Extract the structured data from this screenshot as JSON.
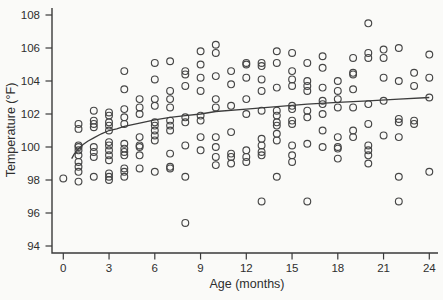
{
  "figure": {
    "background_color": "#fafaf8",
    "ink_color": "#3a3a3a",
    "marker_color": "#464646",
    "curve_color": "#3c3c3c",
    "marker": "open-circle"
  },
  "chart_data": {
    "type": "scatter",
    "title": "",
    "xlabel": "Age (months)",
    "ylabel": "Temperature (°F)",
    "xticks": [
      0,
      3,
      6,
      9,
      12,
      15,
      18,
      21,
      24
    ],
    "yticks": [
      94,
      96,
      98,
      100,
      102,
      104,
      106,
      108
    ],
    "xlim": [
      -0.8,
      25
    ],
    "ylim": [
      93.4,
      108.5
    ],
    "grid": false,
    "legend": null,
    "points": [
      [
        0,
        98.1
      ],
      [
        1,
        101.4
      ],
      [
        1,
        101.1
      ],
      [
        1,
        100.1
      ],
      [
        1,
        100.0
      ],
      [
        1,
        99.8
      ],
      [
        1,
        99.5
      ],
      [
        1,
        99.1
      ],
      [
        1,
        98.8
      ],
      [
        1,
        98.5
      ],
      [
        1,
        97.9
      ],
      [
        2,
        102.2
      ],
      [
        2,
        101.6
      ],
      [
        2,
        101.4
      ],
      [
        2,
        101.2
      ],
      [
        2,
        100.0
      ],
      [
        2,
        99.7
      ],
      [
        2,
        99.4
      ],
      [
        2,
        98.2
      ],
      [
        3,
        102.1
      ],
      [
        3,
        101.9
      ],
      [
        3,
        101.5
      ],
      [
        3,
        101.3
      ],
      [
        3,
        101.0
      ],
      [
        3,
        100.3
      ],
      [
        3,
        100.1
      ],
      [
        3,
        99.8
      ],
      [
        3,
        99.5
      ],
      [
        3,
        99.2
      ],
      [
        3,
        98.4
      ],
      [
        3,
        98.2
      ],
      [
        3,
        98.0
      ],
      [
        4,
        104.6
      ],
      [
        4,
        103.5
      ],
      [
        4,
        102.3
      ],
      [
        4,
        101.8
      ],
      [
        4,
        101.4
      ],
      [
        4,
        100.2
      ],
      [
        4,
        99.9
      ],
      [
        4,
        99.7
      ],
      [
        4,
        99.5
      ],
      [
        4,
        98.7
      ],
      [
        4,
        98.5
      ],
      [
        4,
        98.2
      ],
      [
        5,
        102.9
      ],
      [
        5,
        102.4
      ],
      [
        5,
        102.0
      ],
      [
        5,
        100.6
      ],
      [
        5,
        100.1
      ],
      [
        5,
        100.0
      ],
      [
        5,
        99.5
      ],
      [
        5,
        98.7
      ],
      [
        6,
        105.1
      ],
      [
        6,
        104.1
      ],
      [
        6,
        102.9
      ],
      [
        6,
        102.5
      ],
      [
        6,
        101.5
      ],
      [
        6,
        101.3
      ],
      [
        6,
        101.0
      ],
      [
        6,
        100.7
      ],
      [
        6,
        100.4
      ],
      [
        6,
        98.5
      ],
      [
        7,
        105.2
      ],
      [
        7,
        103.4
      ],
      [
        7,
        102.9
      ],
      [
        7,
        102.4
      ],
      [
        7,
        101.6
      ],
      [
        7,
        101.3
      ],
      [
        7,
        101.0
      ],
      [
        7,
        99.6
      ],
      [
        7,
        98.8
      ],
      [
        7,
        98.7
      ],
      [
        8,
        104.6
      ],
      [
        8,
        104.4
      ],
      [
        8,
        103.7
      ],
      [
        8,
        101.8
      ],
      [
        8,
        101.5
      ],
      [
        8,
        100.1
      ],
      [
        8,
        98.2
      ],
      [
        8,
        95.4
      ],
      [
        9,
        105.8
      ],
      [
        9,
        105.0
      ],
      [
        9,
        104.2
      ],
      [
        9,
        103.4
      ],
      [
        9,
        101.9
      ],
      [
        9,
        101.6
      ],
      [
        9,
        100.6
      ],
      [
        9,
        99.8
      ],
      [
        10,
        106.2
      ],
      [
        10,
        105.7
      ],
      [
        10,
        104.3
      ],
      [
        10,
        102.9
      ],
      [
        10,
        102.4
      ],
      [
        10,
        100.6
      ],
      [
        10,
        100.0
      ],
      [
        10,
        99.4
      ],
      [
        10,
        98.9
      ],
      [
        11,
        104.6
      ],
      [
        11,
        103.8
      ],
      [
        11,
        102.5
      ],
      [
        11,
        100.9
      ],
      [
        11,
        99.6
      ],
      [
        11,
        99.4
      ],
      [
        11,
        99.0
      ],
      [
        12,
        105.1
      ],
      [
        12,
        105.0
      ],
      [
        12,
        104.2
      ],
      [
        12,
        102.9
      ],
      [
        12,
        102.0
      ],
      [
        12,
        99.8
      ],
      [
        12,
        99.4
      ],
      [
        12,
        99.1
      ],
      [
        13,
        105.1
      ],
      [
        13,
        104.9
      ],
      [
        13,
        104.1
      ],
      [
        13,
        103.4
      ],
      [
        13,
        102.2
      ],
      [
        13,
        100.5
      ],
      [
        13,
        100.1
      ],
      [
        13,
        99.7
      ],
      [
        13,
        99.5
      ],
      [
        13,
        96.7
      ],
      [
        14,
        105.8
      ],
      [
        14,
        105.1
      ],
      [
        14,
        103.6
      ],
      [
        14,
        102.2
      ],
      [
        14,
        101.9
      ],
      [
        14,
        101.5
      ],
      [
        14,
        101.3
      ],
      [
        14,
        100.8
      ],
      [
        14,
        100.4
      ],
      [
        14,
        98.2
      ],
      [
        15,
        105.7
      ],
      [
        15,
        104.6
      ],
      [
        15,
        104.1
      ],
      [
        15,
        103.7
      ],
      [
        15,
        102.5
      ],
      [
        15,
        102.3
      ],
      [
        15,
        101.6
      ],
      [
        15,
        101.4
      ],
      [
        15,
        100.1
      ],
      [
        15,
        99.5
      ],
      [
        15,
        99.1
      ],
      [
        16,
        105.1
      ],
      [
        16,
        104.0
      ],
      [
        16,
        103.7
      ],
      [
        16,
        103.4
      ],
      [
        16,
        102.2
      ],
      [
        16,
        101.8
      ],
      [
        16,
        100.2
      ],
      [
        16,
        96.7
      ],
      [
        17,
        105.5
      ],
      [
        17,
        104.8
      ],
      [
        17,
        103.6
      ],
      [
        17,
        102.8
      ],
      [
        17,
        102.6
      ],
      [
        17,
        102.0
      ],
      [
        17,
        101.0
      ],
      [
        17,
        100.0
      ],
      [
        18,
        104.0
      ],
      [
        18,
        103.4
      ],
      [
        18,
        102.9
      ],
      [
        18,
        102.4
      ],
      [
        18,
        100.6
      ],
      [
        18,
        100.0
      ],
      [
        18,
        99.9
      ],
      [
        18,
        99.3
      ],
      [
        19,
        105.4
      ],
      [
        19,
        104.5
      ],
      [
        19,
        104.4
      ],
      [
        19,
        103.5
      ],
      [
        19,
        102.4
      ],
      [
        19,
        101.0
      ],
      [
        19,
        100.6
      ],
      [
        20,
        107.5
      ],
      [
        20,
        105.7
      ],
      [
        20,
        105.4
      ],
      [
        20,
        102.6
      ],
      [
        20,
        101.4
      ],
      [
        20,
        100.1
      ],
      [
        20,
        99.8
      ],
      [
        20,
        99.5
      ],
      [
        20,
        99.0
      ],
      [
        21,
        105.9
      ],
      [
        21,
        105.4
      ],
      [
        21,
        104.2
      ],
      [
        21,
        102.8
      ],
      [
        21,
        100.7
      ],
      [
        22,
        106.0
      ],
      [
        22,
        104.0
      ],
      [
        22,
        101.7
      ],
      [
        22,
        101.5
      ],
      [
        22,
        100.6
      ],
      [
        22,
        98.2
      ],
      [
        22,
        96.7
      ],
      [
        23,
        104.5
      ],
      [
        23,
        103.7
      ],
      [
        23,
        101.6
      ],
      [
        23,
        101.4
      ],
      [
        24,
        105.6
      ],
      [
        24,
        104.2
      ],
      [
        24,
        103.0
      ],
      [
        24,
        98.5
      ]
    ],
    "fit_curve": {
      "label": "logarithmic trend",
      "points": [
        [
          0.55,
          99.3
        ],
        [
          0.7,
          99.55
        ],
        [
          0.85,
          99.75
        ],
        [
          1,
          99.9
        ],
        [
          1.3,
          100.15
        ],
        [
          1.6,
          100.35
        ],
        [
          2,
          100.55
        ],
        [
          2.5,
          100.8
        ],
        [
          3,
          101.0
        ],
        [
          3.5,
          101.1
        ],
        [
          4,
          101.25
        ],
        [
          5,
          101.45
        ],
        [
          6,
          101.65
        ],
        [
          7,
          101.8
        ],
        [
          8,
          101.9
        ],
        [
          9,
          102.0
        ],
        [
          10,
          102.15
        ],
        [
          12,
          102.3
        ],
        [
          14,
          102.45
        ],
        [
          16,
          102.6
        ],
        [
          18,
          102.7
        ],
        [
          20,
          102.8
        ],
        [
          22,
          102.9
        ],
        [
          24,
          103.0
        ]
      ]
    }
  }
}
